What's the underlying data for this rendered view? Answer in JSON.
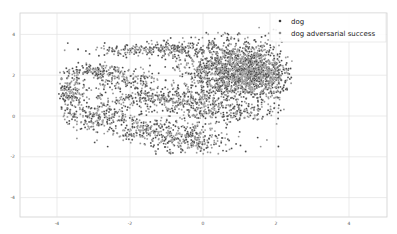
{
  "chart_data": {
    "type": "scatter",
    "title": "",
    "xlabel": "",
    "ylabel": "",
    "xlim": [
      -5,
      5
    ],
    "ylim": [
      -5,
      5
    ],
    "grid": true,
    "legend_position": "upper right",
    "x_ticks": [
      -4,
      -2,
      0,
      2,
      4
    ],
    "y_ticks": [
      4,
      2,
      0,
      -2,
      -4
    ],
    "x_tick_labels": [
      "-4",
      "-2",
      "0",
      "2",
      "4"
    ],
    "y_tick_labels": [
      "4",
      "2",
      "0",
      "-2",
      "-4"
    ],
    "series": [
      {
        "name": "dog",
        "color": "#3a3a3a"
      },
      {
        "name": "dog adversarial success",
        "color": "#8a8a8a"
      }
    ],
    "point_clusters": [
      {
        "description": "dense main blob",
        "cx": 0.9,
        "cy": 2.2,
        "sx": 0.65,
        "sy": 0.75,
        "n": 1500,
        "series_mix": 0.5
      },
      {
        "description": "blob right tail",
        "cx": 1.7,
        "cy": 2.0,
        "sx": 0.35,
        "sy": 0.6,
        "n": 300,
        "series_mix": 0.5
      },
      {
        "description": "upper arc left",
        "cx": -1.8,
        "cy": 3.2,
        "sx": 0.7,
        "sy": 0.15,
        "n": 160,
        "series_mix": 0.5
      },
      {
        "description": "upper arc mid",
        "cx": -0.6,
        "cy": 3.3,
        "sx": 0.45,
        "sy": 0.2,
        "n": 120,
        "series_mix": 0.5
      },
      {
        "description": "left loop top",
        "cx": -3.0,
        "cy": 2.2,
        "sx": 0.45,
        "sy": 0.2,
        "n": 140,
        "series_mix": 0.5
      },
      {
        "description": "left nose",
        "cx": -3.6,
        "cy": 1.1,
        "sx": 0.18,
        "sy": 0.45,
        "n": 150,
        "series_mix": 0.5
      },
      {
        "description": "left lower arc",
        "cx": -2.9,
        "cy": 0.0,
        "sx": 0.5,
        "sy": 0.3,
        "n": 220,
        "series_mix": 0.5
      },
      {
        "description": "middle band",
        "cx": -1.6,
        "cy": 0.9,
        "sx": 0.9,
        "sy": 0.2,
        "n": 200,
        "series_mix": 0.5
      },
      {
        "description": "inner streak",
        "cx": -2.2,
        "cy": 1.8,
        "sx": 0.55,
        "sy": 0.25,
        "n": 110,
        "series_mix": 0.5
      },
      {
        "description": "lower band",
        "cx": -1.5,
        "cy": -0.7,
        "sx": 0.7,
        "sy": 0.3,
        "n": 200,
        "series_mix": 0.5
      },
      {
        "description": "bottom lobe",
        "cx": -0.4,
        "cy": -1.2,
        "sx": 0.6,
        "sy": 0.3,
        "n": 240,
        "series_mix": 0.5
      },
      {
        "description": "lower right arc",
        "cx": 0.9,
        "cy": 0.2,
        "sx": 0.7,
        "sy": 0.25,
        "n": 150,
        "series_mix": 0.5
      },
      {
        "description": "mid bridge",
        "cx": -0.3,
        "cy": 0.6,
        "sx": 0.5,
        "sy": 0.4,
        "n": 160,
        "series_mix": 0.5
      },
      {
        "description": "sparse fill",
        "cx": -1.2,
        "cy": 1.0,
        "sx": 1.2,
        "sy": 1.2,
        "n": 200,
        "series_mix": 0.5
      }
    ]
  },
  "legend": {
    "items": [
      {
        "label": "dog",
        "color": "#3a3a3a"
      },
      {
        "label": "dog adversarial success",
        "color": "#8a8a8a"
      }
    ]
  }
}
